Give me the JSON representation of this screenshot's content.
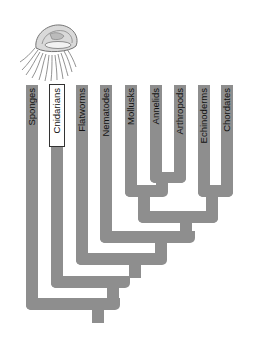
{
  "diagram": {
    "type": "phylogenetic-tree",
    "highlighted_taxon": "Cnidarians",
    "illustration": "jellyfish",
    "colors": {
      "branch": "#8e8e8e",
      "highlight_box": "#ffffff",
      "text": "#111111"
    },
    "taxa": [
      {
        "label": "Sponges"
      },
      {
        "label": "Cnidarians"
      },
      {
        "label": "Flatworms"
      },
      {
        "label": "Nematodes"
      },
      {
        "label": "Mollusks"
      },
      {
        "label": "Annelids"
      },
      {
        "label": "Arthropods"
      },
      {
        "label": "Echinoderms"
      },
      {
        "label": "Chordates"
      }
    ]
  }
}
